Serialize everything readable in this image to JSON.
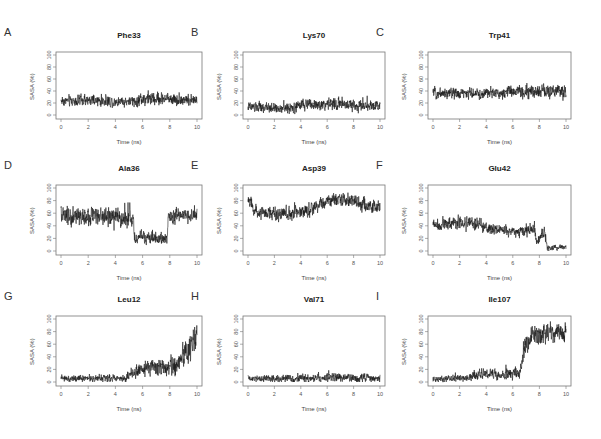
{
  "figure": {
    "ylabel": "SASA (%)",
    "xlabel": "Time (ns)",
    "x_ticks": [
      "0",
      "2",
      "4",
      "6",
      "8",
      "10"
    ],
    "y_ticks": [
      "0",
      "20",
      "40",
      "60",
      "80",
      "100"
    ],
    "line_color": "#1a1a1a",
    "frame_color": "#777777"
  },
  "panels": [
    {
      "letter": "A",
      "title": "Phe33"
    },
    {
      "letter": "B",
      "title": "Lys70"
    },
    {
      "letter": "C",
      "title": "Trp41"
    },
    {
      "letter": "D",
      "title": "Ala36"
    },
    {
      "letter": "E",
      "title": "Asp39"
    },
    {
      "letter": "F",
      "title": "Glu42"
    },
    {
      "letter": "G",
      "title": "Leu12"
    },
    {
      "letter": "H",
      "title": "Val71"
    },
    {
      "letter": "I",
      "title": "Ile107"
    }
  ],
  "chart_data": [
    {
      "panel": "A",
      "type": "line",
      "title": "Phe33",
      "xlabel": "Time (ns)",
      "ylabel": "SASA (%)",
      "xlim": [
        0,
        10
      ],
      "ylim": [
        0,
        100
      ],
      "profile": [
        [
          0,
          24,
          8
        ],
        [
          5.8,
          22,
          8
        ],
        [
          5.8,
          28,
          10
        ],
        [
          7.6,
          26,
          10
        ],
        [
          7.6,
          22,
          8
        ],
        [
          7.8,
          28,
          9
        ],
        [
          10,
          24,
          8
        ]
      ]
    },
    {
      "panel": "B",
      "type": "line",
      "title": "Lys70",
      "xlabel": "Time (ns)",
      "ylabel": "SASA (%)",
      "xlabel2": "",
      "xlim": [
        0,
        10
      ],
      "ylim": [
        0,
        100
      ],
      "profile": [
        [
          0,
          13,
          7
        ],
        [
          3.5,
          11,
          7
        ],
        [
          4,
          17,
          8
        ],
        [
          7,
          18,
          9
        ],
        [
          10,
          15,
          9
        ]
      ]
    },
    {
      "panel": "C",
      "type": "line",
      "title": "Trp41",
      "xlabel": "Time (ns)",
      "ylabel": "SASA (%)",
      "xlim": [
        0,
        10
      ],
      "ylim": [
        0,
        100
      ],
      "profile": [
        [
          0,
          37,
          8
        ],
        [
          4,
          35,
          8
        ],
        [
          5.5,
          38,
          9
        ],
        [
          10,
          40,
          10
        ]
      ]
    },
    {
      "panel": "D",
      "type": "line",
      "title": "Ala36",
      "xlabel": "Time (ns)",
      "ylabel": "SASA (%)",
      "xlim": [
        0,
        10
      ],
      "ylim": [
        0,
        100
      ],
      "profile": [
        [
          0,
          55,
          14
        ],
        [
          5.3,
          52,
          13
        ],
        [
          5.4,
          22,
          9
        ],
        [
          7.8,
          20,
          9
        ],
        [
          7.9,
          55,
          10
        ],
        [
          10,
          55,
          10
        ]
      ]
    },
    {
      "panel": "E",
      "type": "line",
      "title": "Asp39",
      "xlabel": "Time (ns)",
      "ylabel": "SASA (%)",
      "xlim": [
        0,
        10
      ],
      "ylim": [
        0,
        100
      ],
      "profile": [
        [
          0,
          80,
          10
        ],
        [
          0.5,
          65,
          10
        ],
        [
          3,
          58,
          10
        ],
        [
          4.5,
          65,
          10
        ],
        [
          6.5,
          82,
          9
        ],
        [
          8,
          80,
          9
        ],
        [
          9,
          70,
          10
        ],
        [
          10,
          70,
          10
        ]
      ]
    },
    {
      "panel": "F",
      "type": "line",
      "title": "Glu42",
      "xlabel": "Time (ns)",
      "ylabel": "SASA (%)",
      "xlim": [
        0,
        10
      ],
      "ylim": [
        0,
        100
      ],
      "profile": [
        [
          0,
          42,
          8
        ],
        [
          2.5,
          45,
          10
        ],
        [
          4,
          38,
          8
        ],
        [
          6,
          30,
          8
        ],
        [
          7.6,
          35,
          9
        ],
        [
          7.8,
          15,
          6
        ],
        [
          8.4,
          30,
          10
        ],
        [
          8.6,
          5,
          4
        ],
        [
          10,
          6,
          4
        ]
      ]
    },
    {
      "panel": "G",
      "type": "line",
      "title": "Leu12",
      "xlabel": "Time (ns)",
      "ylabel": "SASA (%)",
      "xlim": [
        0,
        10
      ],
      "ylim": [
        0,
        100
      ],
      "profile": [
        [
          0,
          5,
          5
        ],
        [
          4.8,
          6,
          5
        ],
        [
          5.2,
          15,
          8
        ],
        [
          7,
          22,
          12
        ],
        [
          8.5,
          25,
          14
        ],
        [
          9.5,
          55,
          20
        ],
        [
          10,
          70,
          20
        ]
      ]
    },
    {
      "panel": "H",
      "type": "line",
      "title": "Val71",
      "xlabel": "Time (ns)",
      "ylabel": "SASA (%)",
      "xlim": [
        0,
        10
      ],
      "ylim": [
        0,
        100
      ],
      "profile": [
        [
          0,
          5,
          5
        ],
        [
          5,
          6,
          6
        ],
        [
          10,
          6,
          6
        ]
      ]
    },
    {
      "panel": "I",
      "type": "line",
      "title": "Ile107",
      "xlabel": "Time (ns)",
      "ylabel": "SASA (%)",
      "xlim": [
        0,
        10
      ],
      "ylim": [
        0,
        100
      ],
      "profile": [
        [
          0,
          5,
          5
        ],
        [
          2.8,
          6,
          5
        ],
        [
          3,
          12,
          7
        ],
        [
          5,
          12,
          7
        ],
        [
          6.6,
          15,
          10
        ],
        [
          6.8,
          50,
          15
        ],
        [
          7.5,
          75,
          14
        ],
        [
          10,
          80,
          14
        ]
      ]
    }
  ]
}
